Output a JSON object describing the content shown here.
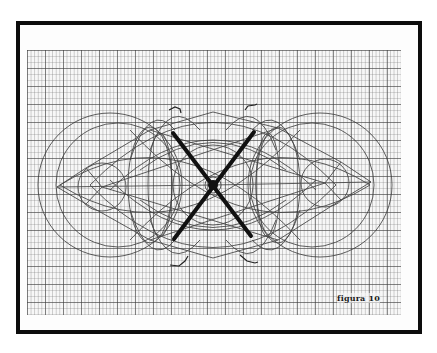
{
  "figure": {
    "caption": "figura 10",
    "background_color": "#ffffff",
    "frame_color": "#0d0d0d",
    "line_color": "#333333",
    "thick_line_color": "#111111",
    "grid": {
      "type": "graph-paper",
      "major_spacing_px": 18,
      "minor_spacing_px": 3.6
    },
    "elements": {
      "outer_circles": [
        "left",
        "right"
      ],
      "inner_rosettes": [
        "left",
        "right"
      ],
      "thick_cross": "X through center",
      "markers": [
        "top-left hook",
        "top-right hook",
        "bottom-left hook",
        "bottom-right hook"
      ]
    }
  }
}
